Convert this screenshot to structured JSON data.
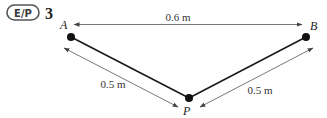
{
  "badge": {
    "label": "E/P"
  },
  "question": {
    "number": "3"
  },
  "points": {
    "A": {
      "label": "A"
    },
    "B": {
      "label": "B"
    },
    "P": {
      "label": "P"
    }
  },
  "dimensions": {
    "AB": "0.6 m",
    "AP": "0.5 m",
    "BP": "0.5 m"
  },
  "colors": {
    "string": "#1a1a1a",
    "dimension_line": "#555555",
    "badge_border": "#555555"
  }
}
